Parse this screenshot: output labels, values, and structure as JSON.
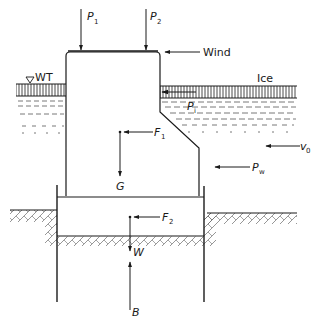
{
  "diagram": {
    "title": "",
    "type": "bridge pier free-body force diagram",
    "labels": {
      "p1": "P",
      "p1_sub": "1",
      "p2": "P",
      "p2_sub": "2",
      "wind": "Wind",
      "water_table": "WT",
      "ice": "Ice",
      "pi": "P",
      "pi_sub": "i",
      "f1": "F",
      "f1_sub": "1",
      "g": "G",
      "v0": "v",
      "v0_sub": "0",
      "pw": "P",
      "pw_sub": "w",
      "f2": "F",
      "f2_sub": "2",
      "w": "W",
      "b": "B"
    },
    "forces": [
      {
        "name": "P1",
        "direction": "down",
        "description": "vertical load 1"
      },
      {
        "name": "P2",
        "direction": "down",
        "description": "vertical load 2"
      },
      {
        "name": "Wind",
        "direction": "left",
        "description": "wind load"
      },
      {
        "name": "Pi",
        "direction": "left",
        "description": "ice pressure"
      },
      {
        "name": "F1",
        "direction": "left",
        "description": "horizontal force on pier"
      },
      {
        "name": "G",
        "direction": "down",
        "description": "self-weight of pier"
      },
      {
        "name": "v0",
        "direction": "left",
        "description": "water velocity"
      },
      {
        "name": "Pw",
        "direction": "left",
        "description": "water pressure"
      },
      {
        "name": "F2",
        "direction": "left",
        "description": "horizontal force on footing"
      },
      {
        "name": "W",
        "direction": "down",
        "description": "weight of footing"
      },
      {
        "name": "B",
        "direction": "up",
        "description": "buoyancy"
      }
    ],
    "colors": {
      "line": "#1a1a1a",
      "hatch": "#555555",
      "background": "#ffffff"
    }
  }
}
